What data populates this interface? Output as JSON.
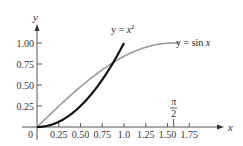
{
  "chart_data": {
    "type": "line",
    "title": "",
    "xlabel": "x",
    "ylabel": "y",
    "xlim": [
      0,
      1.85
    ],
    "ylim": [
      0,
      1.15
    ],
    "grid": false,
    "x_ticks": [
      "0.25",
      "0.50",
      "0.75",
      "1.0",
      "1.25",
      "1.50",
      "1.75"
    ],
    "x_tick_values": [
      0.25,
      0.5,
      0.75,
      1.0,
      1.25,
      1.5,
      1.75
    ],
    "y_ticks": [
      "0.25",
      "0.50",
      "0.75",
      "1.00"
    ],
    "y_tick_values": [
      0.25,
      0.5,
      0.75,
      1.0
    ],
    "origin_label": "0",
    "annotations": [
      {
        "text": "π/2",
        "numerator": "π",
        "denominator": "2",
        "x": 1.5708
      }
    ],
    "series": [
      {
        "name": "y = x²",
        "label_prefix": "y = x",
        "label_sup": "2",
        "color": "#111111",
        "x": [
          0,
          0.1,
          0.2,
          0.3,
          0.4,
          0.5,
          0.6,
          0.7,
          0.8,
          0.9,
          1.0
        ],
        "y": [
          0,
          0.01,
          0.04,
          0.09,
          0.16,
          0.25,
          0.36,
          0.49,
          0.64,
          0.81,
          1.0
        ]
      },
      {
        "name": "y = sin x",
        "label": "y = sin x",
        "color": "#999999",
        "x": [
          0,
          0.2,
          0.4,
          0.6,
          0.8,
          1.0,
          1.2,
          1.4,
          1.5708
        ],
        "y": [
          0,
          0.199,
          0.389,
          0.565,
          0.717,
          0.841,
          0.932,
          0.985,
          1.0
        ]
      }
    ]
  }
}
